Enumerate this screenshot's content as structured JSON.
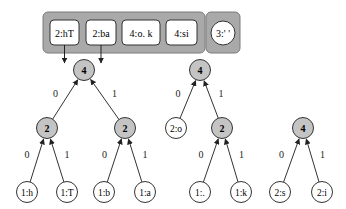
{
  "queue": {
    "items": [
      {
        "label": "2:hT"
      },
      {
        "label": "2:ba"
      },
      {
        "label": "4:o. k"
      },
      {
        "label": "4:si"
      }
    ],
    "extra_item": {
      "label": "3:' '"
    }
  },
  "colors": {
    "container_fill": "#a9a9a9",
    "container_stroke": "#7a7a7a",
    "internal_node_fill": "#c4c4c4",
    "leaf_fill": "#ffffff",
    "stroke": "#333333"
  },
  "trees": [
    {
      "id": "tree-a",
      "root": "4",
      "internal": [
        {
          "id": "a-l",
          "label": "2"
        },
        {
          "id": "a-r",
          "label": "2"
        }
      ],
      "leaves": [
        {
          "id": "a-ll",
          "label": "1:h"
        },
        {
          "id": "a-lr",
          "label": "1:T"
        },
        {
          "id": "a-rl",
          "label": "1:b"
        },
        {
          "id": "a-rr",
          "label": "1:a"
        }
      ]
    },
    {
      "id": "tree-b",
      "root": "4",
      "internal": [
        {
          "id": "b-r",
          "label": "2"
        }
      ],
      "leaves": [
        {
          "id": "b-l",
          "label": "2:o"
        },
        {
          "id": "b-rl",
          "label": "1:."
        },
        {
          "id": "b-rr",
          "label": "1:k"
        }
      ]
    },
    {
      "id": "tree-c",
      "root": "4",
      "internal": [],
      "leaves": [
        {
          "id": "c-l",
          "label": "2:s"
        },
        {
          "id": "c-r",
          "label": "2:i"
        }
      ]
    }
  ],
  "edge_labels": {
    "left": "0",
    "right": "1"
  }
}
